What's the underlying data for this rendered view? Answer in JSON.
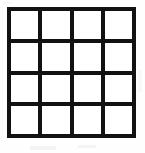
{
  "figure": {
    "name": "blank-4x4-grid",
    "type": "grid",
    "rows": 4,
    "columns": 4,
    "cell_count": 16,
    "line_color": "#121212",
    "cell_color": "#ffffff",
    "background_color": "#fefefe",
    "line_width_px": 4,
    "grid_bounds_px": {
      "left": 7,
      "top": 7,
      "width": 129,
      "height": 131
    },
    "vertical_line_x_px": [
      7,
      38,
      68,
      100,
      133
    ],
    "horizontal_line_y_px": [
      8,
      41,
      73,
      105,
      137
    ],
    "cells": [
      {
        "row": 1,
        "col": 1,
        "label": ""
      },
      {
        "row": 1,
        "col": 2,
        "label": ""
      },
      {
        "row": 1,
        "col": 3,
        "label": ""
      },
      {
        "row": 1,
        "col": 4,
        "label": ""
      },
      {
        "row": 2,
        "col": 1,
        "label": ""
      },
      {
        "row": 2,
        "col": 2,
        "label": ""
      },
      {
        "row": 2,
        "col": 3,
        "label": ""
      },
      {
        "row": 2,
        "col": 4,
        "label": ""
      },
      {
        "row": 3,
        "col": 1,
        "label": ""
      },
      {
        "row": 3,
        "col": 2,
        "label": ""
      },
      {
        "row": 3,
        "col": 3,
        "label": ""
      },
      {
        "row": 3,
        "col": 4,
        "label": ""
      },
      {
        "row": 4,
        "col": 1,
        "label": ""
      },
      {
        "row": 4,
        "col": 2,
        "label": ""
      },
      {
        "row": 4,
        "col": 3,
        "label": ""
      },
      {
        "row": 4,
        "col": 4,
        "label": ""
      }
    ]
  }
}
